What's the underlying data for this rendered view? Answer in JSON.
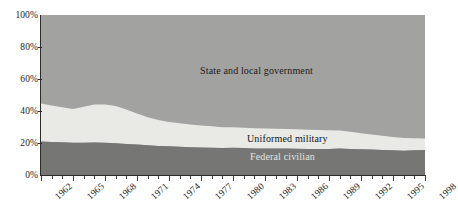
{
  "chart_data": {
    "type": "area",
    "stacked": true,
    "normalized": true,
    "title": "",
    "subtitle": "",
    "xlabel": "",
    "ylabel": "",
    "xlim": [
      1962,
      1998
    ],
    "ylim": [
      0,
      100
    ],
    "grid": false,
    "legend_position": "inline-on-bands",
    "y_ticks": [
      "0%",
      "20%",
      "40%",
      "60%",
      "80%",
      "100%"
    ],
    "y_tick_values": [
      0,
      20,
      40,
      60,
      80,
      100
    ],
    "x_ticks": [
      "1962",
      "1965",
      "1968",
      "1971",
      "1974",
      "1977",
      "1980",
      "1983",
      "1986",
      "1989",
      "1992",
      "1995",
      "1998"
    ],
    "x_tick_values": [
      1962,
      1965,
      1968,
      1971,
      1974,
      1977,
      1980,
      1983,
      1986,
      1989,
      1992,
      1995,
      1998
    ],
    "x": [
      1962,
      1963,
      1964,
      1965,
      1966,
      1967,
      1968,
      1969,
      1970,
      1971,
      1972,
      1973,
      1974,
      1975,
      1976,
      1977,
      1978,
      1979,
      1980,
      1981,
      1982,
      1983,
      1984,
      1985,
      1986,
      1987,
      1988,
      1989,
      1990,
      1991,
      1992,
      1993,
      1994,
      1995,
      1996,
      1997,
      1998
    ],
    "series": [
      {
        "name": "Federal civilian",
        "color": "#767674",
        "order": 1,
        "values": [
          20.9,
          20.7,
          20.4,
          20.2,
          20.1,
          20.3,
          20.2,
          19.8,
          19.4,
          19.0,
          18.6,
          18.2,
          18.0,
          17.7,
          17.4,
          17.2,
          17.1,
          16.9,
          17.0,
          16.8,
          16.6,
          16.5,
          16.5,
          16.5,
          16.4,
          16.3,
          16.3,
          16.3,
          16.6,
          16.3,
          16.1,
          15.9,
          15.7,
          15.4,
          15.2,
          15.5,
          15.6
        ]
      },
      {
        "name": "Uniformed military",
        "color": "#e9e9e5",
        "order": 2,
        "values": [
          23.8,
          22.8,
          21.9,
          21.0,
          22.5,
          23.8,
          23.9,
          23.3,
          21.5,
          19.5,
          17.5,
          16.2,
          15.2,
          14.6,
          14.1,
          13.7,
          13.3,
          13.0,
          12.8,
          12.7,
          12.6,
          12.5,
          12.4,
          12.3,
          12.2,
          12.0,
          11.8,
          11.6,
          11.2,
          10.7,
          10.0,
          9.4,
          8.9,
          8.3,
          7.9,
          7.5,
          7.2
        ]
      },
      {
        "name": "State and local government",
        "color": "#a2a2a0",
        "order": 3,
        "values": [
          55.3,
          56.5,
          57.7,
          58.8,
          57.4,
          55.9,
          55.9,
          56.9,
          59.1,
          61.5,
          63.9,
          65.6,
          66.8,
          67.7,
          68.5,
          69.1,
          69.6,
          70.1,
          70.2,
          70.5,
          70.8,
          71.0,
          71.1,
          71.2,
          71.4,
          71.7,
          71.9,
          72.1,
          72.2,
          73.0,
          73.9,
          74.7,
          75.4,
          76.3,
          76.9,
          77.0,
          77.2
        ]
      }
    ],
    "annotations": [
      {
        "text": "State and local government",
        "x": 1980,
        "y": 62
      },
      {
        "text": "Uniformed military",
        "x": 1984,
        "y": 26
      },
      {
        "text": "Federal civilian",
        "x": 1984,
        "y": 14
      }
    ]
  },
  "axes": {
    "y_labels": [
      "100%",
      "80%",
      "60%",
      "40%",
      "20%",
      "0%"
    ],
    "x_labels": [
      "1962",
      "1965",
      "1968",
      "1971",
      "1974",
      "1977",
      "1980",
      "1983",
      "1986",
      "1989",
      "1992",
      "1995",
      "1998"
    ]
  },
  "labels": {
    "state_local": "State and local government",
    "uniformed_military": "Uniformed military",
    "federal_civilian": "Federal civilian"
  },
  "colors": {
    "state_local": "#a2a2a0",
    "uniformed_military": "#e9e9e5",
    "federal_civilian": "#767674",
    "axis": "#2b2b2b",
    "background": "#ffffff",
    "text": "#1c1c1c"
  }
}
